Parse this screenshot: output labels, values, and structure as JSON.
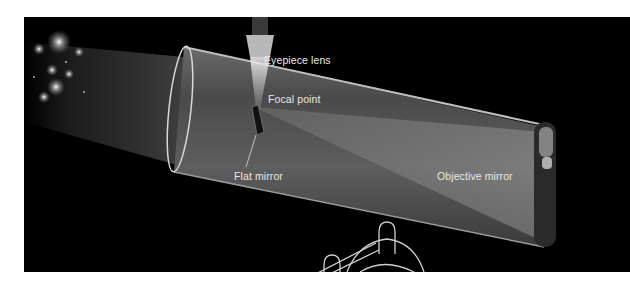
{
  "figure": {
    "background_color": "#000000",
    "page_color": "#ffffff",
    "label_color": "#e8e8e8",
    "labels": {
      "eyepiece_lens": "Eyepiece lens",
      "focal_point": "Focal point",
      "flat_mirror": "Flat mirror",
      "objective_mirror": "Objective mirror"
    }
  }
}
